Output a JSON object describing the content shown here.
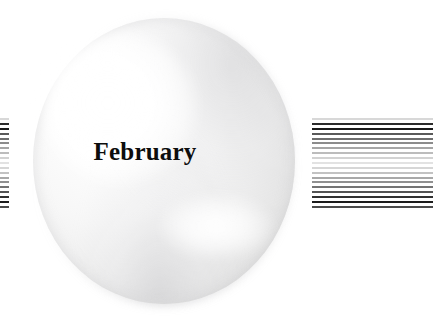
{
  "canvas": {
    "width": 435,
    "height": 332,
    "background": "#ffffff"
  },
  "button": {
    "label": "February",
    "shape": "circle",
    "style": "glossy-dome",
    "label_color": "#0d0d0d",
    "body_color_light": "#ffffff",
    "body_color_dark": "#c8c8ca",
    "highlight_color": "#ffffff",
    "shadow_color": "#808084"
  },
  "stripes": {
    "left": {
      "name": "stripe-block-left",
      "cropped": true,
      "count": 19,
      "colors": [
        "#d8d8d8",
        "#2b2b2b",
        "#1a1a1a",
        "#5a5a5a",
        "#6e6e6e",
        "#8c8c8c",
        "#a6a6a6",
        "#bcbcbc",
        "#d2d2d2",
        "#e2e2e2",
        "#d6d6d6",
        "#c2c2c2",
        "#a8a8a8",
        "#909090",
        "#747474",
        "#545454",
        "#303030",
        "#1c1c1c",
        "#4a4a4a"
      ]
    },
    "right": {
      "name": "stripe-block-right",
      "cropped": false,
      "count": 19,
      "colors": [
        "#d8d8d8",
        "#2b2b2b",
        "#1a1a1a",
        "#5a5a5a",
        "#6e6e6e",
        "#8c8c8c",
        "#a6a6a6",
        "#bcbcbc",
        "#d2d2d2",
        "#e2e2e2",
        "#d6d6d6",
        "#c2c2c2",
        "#a8a8a8",
        "#909090",
        "#747474",
        "#545454",
        "#303030",
        "#1c1c1c",
        "#4a4a4a"
      ]
    }
  }
}
